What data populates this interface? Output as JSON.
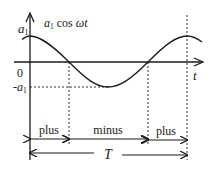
{
  "diagram": {
    "curve_label": "a₁ cos ωt",
    "curve_label_parts": {
      "a": "a",
      "sub": "1",
      "rest": " cos ",
      "omega_t": "ωt"
    },
    "y_axis": {
      "top_label": "a",
      "top_sub": "1",
      "zero_label": "0",
      "neg_label": "-a",
      "neg_sub": "1"
    },
    "x_axis": {
      "label": "t"
    },
    "segments": [
      {
        "label": "plus"
      },
      {
        "label": "minus"
      },
      {
        "label": "plus"
      }
    ],
    "period_label": "T"
  }
}
